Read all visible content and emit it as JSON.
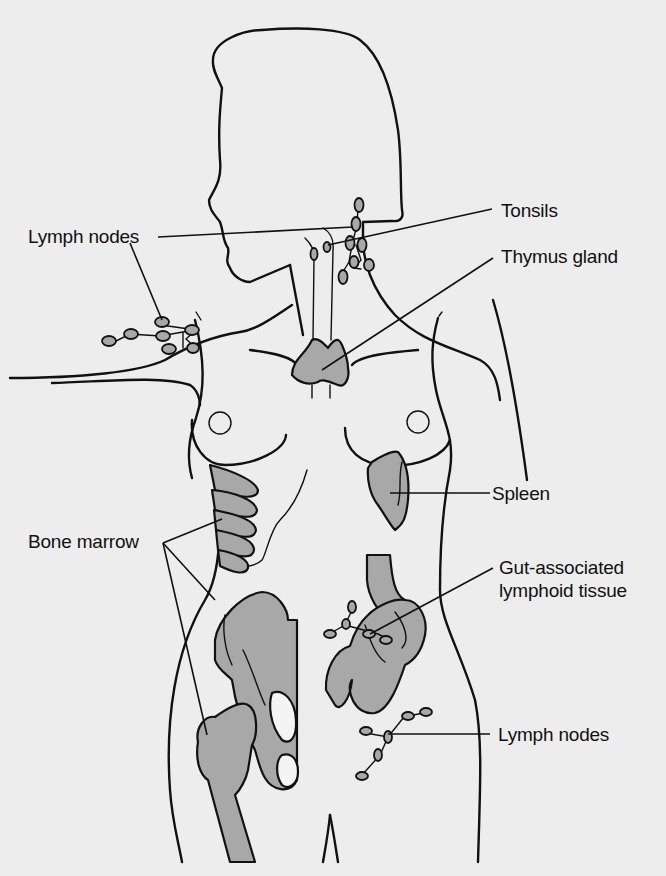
{
  "figure": {
    "background_color": "#ededed",
    "organ_fill_color": "#a8a8a8",
    "line_color": "#111111"
  },
  "labels": {
    "tonsils": "Tonsils",
    "lymph_nodes_neck": "Lymph nodes",
    "thymus": "Thymus gland",
    "spleen": "Spleen",
    "bone_marrow": "Bone marrow",
    "galt_line1": "Gut-associated",
    "galt_line2": "lymphoid tissue",
    "lymph_nodes_groin": "Lymph nodes"
  }
}
